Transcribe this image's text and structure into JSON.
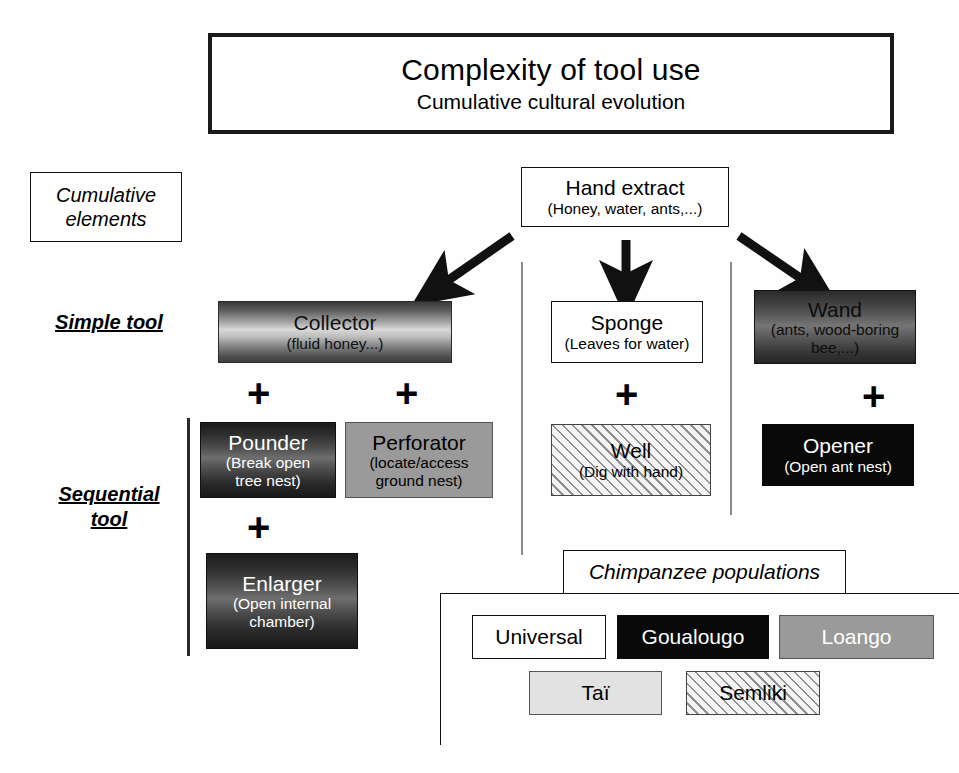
{
  "title": {
    "main": "Complexity of tool use",
    "sub": "Cumulative cultural evolution"
  },
  "row_labels": {
    "cumulative_line1": "Cumulative",
    "cumulative_line2": "elements",
    "simple": "Simple tool",
    "sequential_line1": "Sequential",
    "sequential_line2": "tool"
  },
  "nodes": {
    "hand_extract": {
      "name": "Hand extract",
      "sub": "(Honey, water, ants,...)",
      "fill": "white"
    },
    "collector": {
      "name": "Collector",
      "sub": "(fluid honey...)",
      "fill": "gradient-light"
    },
    "sponge": {
      "name": "Sponge",
      "sub": "(Leaves for water)",
      "fill": "white"
    },
    "wand": {
      "name": "Wand",
      "sub": "(ants, wood-boring",
      "sub2": "bee,...)",
      "fill": "gradient-medium"
    },
    "pounder": {
      "name": "Pounder",
      "sub": "(Break open",
      "sub2": "tree nest)",
      "fill": "gradient-dark"
    },
    "perforator": {
      "name": "Perforator",
      "sub": "(locate/access",
      "sub2": "ground nest)",
      "fill": "gray"
    },
    "well": {
      "name": "Well",
      "sub": "(Dig with hand)",
      "fill": "hatched"
    },
    "opener": {
      "name": "Opener",
      "sub": "(Open ant nest)",
      "fill": "black"
    },
    "enlarger": {
      "name": "Enlarger",
      "sub": "(Open internal",
      "sub2": "chamber)",
      "fill": "gradient-dark"
    }
  },
  "operators": {
    "plus": "+"
  },
  "legend": {
    "title": "Chimpanzee populations",
    "items": [
      {
        "label": "Universal",
        "fill": "white"
      },
      {
        "label": "Goualougo",
        "fill": "black"
      },
      {
        "label": "Loango",
        "fill": "gray"
      },
      {
        "label": "Taï",
        "fill": "light-gray"
      },
      {
        "label": "Semliki",
        "fill": "hatched"
      }
    ]
  },
  "colors": {
    "outline": "#111111",
    "black_fill": "#090909",
    "gray_fill": "#9a9a9a",
    "light_gray_fill": "#e2e2e2",
    "hatch_line": "#8f8f8f"
  }
}
